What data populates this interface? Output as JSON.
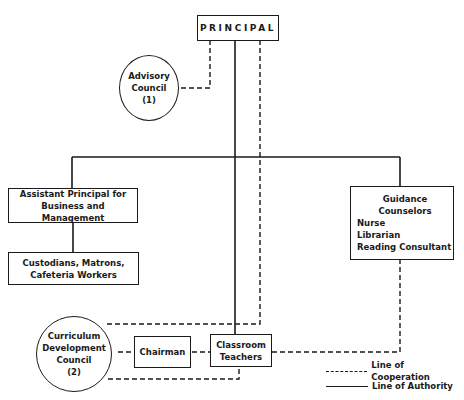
{
  "diagram": {
    "nodes": {
      "principal": {
        "label": "PRINCIPAL",
        "shape": "box"
      },
      "advisory_council": {
        "lines": [
          "Advisory",
          "Council",
          "(1)"
        ],
        "shape": "circle"
      },
      "assistant_principal": {
        "lines": [
          "Assistant Principal for",
          "Business and Management"
        ],
        "shape": "box"
      },
      "custodians": {
        "lines": [
          "Custodians, Matrons,",
          "Cafeteria Workers"
        ],
        "shape": "box"
      },
      "guidance": {
        "lines": [
          "Guidance Counselors",
          "Nurse",
          "Librarian",
          "Reading Consultant"
        ],
        "shape": "box"
      },
      "curriculum_council": {
        "lines": [
          "Curriculum",
          "Development",
          "Council",
          "(2)"
        ],
        "shape": "circle"
      },
      "chairman": {
        "label": "Chairman",
        "shape": "box"
      },
      "classroom_teachers": {
        "lines": [
          "Classroom",
          "Teachers"
        ],
        "shape": "box"
      }
    },
    "edges": [
      {
        "from": "principal",
        "to": "advisory_council",
        "type": "cooperation"
      },
      {
        "from": "principal",
        "to": "assistant_principal",
        "type": "authority"
      },
      {
        "from": "principal",
        "to": "guidance",
        "type": "authority"
      },
      {
        "from": "principal",
        "to": "classroom_teachers",
        "type": "authority"
      },
      {
        "from": "principal",
        "to": "curriculum_council",
        "type": "cooperation"
      },
      {
        "from": "assistant_principal",
        "to": "custodians",
        "type": "authority"
      },
      {
        "from": "curriculum_council",
        "to": "chairman",
        "type": "cooperation"
      },
      {
        "from": "chairman",
        "to": "classroom_teachers",
        "type": "cooperation"
      },
      {
        "from": "classroom_teachers",
        "to": "curriculum_council",
        "type": "cooperation"
      },
      {
        "from": "classroom_teachers",
        "to": "guidance",
        "type": "cooperation"
      }
    ],
    "legend": {
      "cooperation": "Line of Cooperation",
      "authority": "Line of Authority"
    },
    "colors": {
      "ink": "#1a1a1a",
      "background": "#ffffff"
    }
  }
}
